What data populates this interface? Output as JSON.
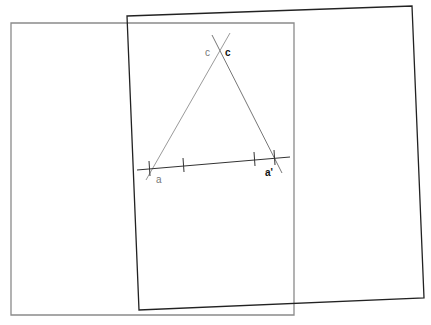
{
  "diagram": {
    "colors": {
      "background": "#ffffff",
      "sheet_gray": "#8a8a8a",
      "sheet_black": "#222222",
      "construction_gray": "#9a9a9a",
      "baseline": "#333333"
    },
    "labels": {
      "c_gray": "c",
      "c_black": "c",
      "a": "a",
      "a_prime": "a'"
    },
    "sheets": [
      {
        "name": "gray-rectangle",
        "points": [
          [
            11,
            23
          ],
          [
            294,
            23
          ],
          [
            294,
            315
          ],
          [
            11,
            315
          ]
        ]
      },
      {
        "name": "black-rotated-rectangle",
        "points": [
          [
            127,
            16
          ],
          [
            412,
            6
          ],
          [
            424,
            298
          ],
          [
            139,
            310
          ]
        ]
      }
    ],
    "baseline": {
      "from": [
        137,
        169
      ],
      "to": [
        290,
        157
      ]
    },
    "triangle_lines": [
      {
        "from": [
          146,
          178
        ],
        "to": [
          230,
          33
        ]
      },
      {
        "from": [
          212,
          35
        ],
        "to": [
          282,
          172
        ]
      }
    ],
    "ticks": [
      {
        "x": 149,
        "y": 168
      },
      {
        "x": 183,
        "y": 165
      },
      {
        "x": 254,
        "y": 159
      },
      {
        "x": 274,
        "y": 158
      }
    ]
  }
}
